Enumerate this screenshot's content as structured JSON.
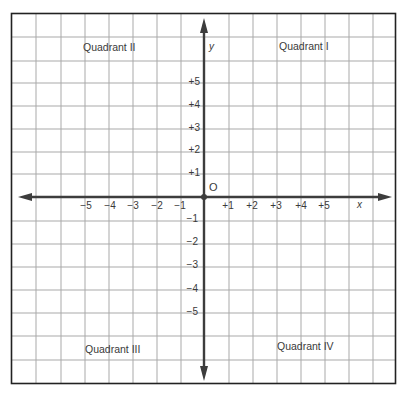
{
  "diagram": {
    "type": "coordinate-plane",
    "colors": {
      "grid": "#a9a9a9",
      "border": "#222222",
      "axis": "#3d3d3d",
      "text": "#3a3a3a"
    },
    "axes": {
      "x_label": "x",
      "y_label": "y",
      "origin_label": "O"
    },
    "x_ticks": [
      "-5",
      "-4",
      "-3",
      "-2",
      "-1",
      "+1",
      "+2",
      "+3",
      "+4",
      "+5"
    ],
    "y_ticks_positive": [
      "+5",
      "+4",
      "+3",
      "+2",
      "+1"
    ],
    "y_ticks_negative": [
      "-1",
      "-2",
      "-3",
      "-4",
      "-5"
    ],
    "quadrants": {
      "q1": "Quadrant I",
      "q2": "Quadrant II",
      "q3": "Quadrant III",
      "q4": "Quadrant IV"
    }
  }
}
